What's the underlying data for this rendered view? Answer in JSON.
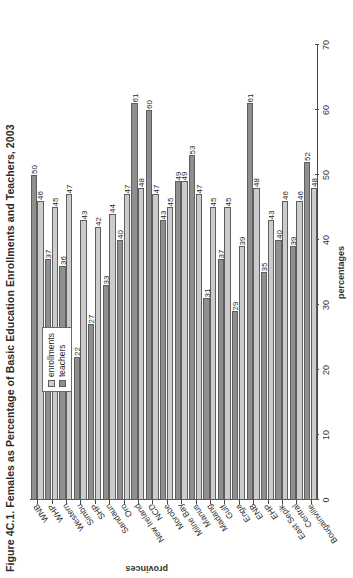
{
  "figure": {
    "title": "Figure 4C.1. Females as Percentage of Basic Education Enrollments and Teachers, 2003"
  },
  "legend": {
    "items": [
      {
        "label": "enrollments",
        "color": "#cccccc",
        "icon": "legend-swatch-icon"
      },
      {
        "label": "teachers",
        "color": "#8f8f8f",
        "icon": "legend-swatch-icon"
      }
    ]
  },
  "chart_data": {
    "type": "bar",
    "title": "Figure 4C.1. Females as Percentage of Basic Education Enrollments and Teachers, 2003",
    "orientation": "horizontal",
    "xlabel": "percentages",
    "ylabel": "provinces",
    "xlim": [
      0,
      70
    ],
    "xticks": [
      0,
      10,
      20,
      30,
      40,
      50,
      60,
      70
    ],
    "grid": false,
    "legend_position": "upper-center",
    "categories": [
      "Bougainville",
      "Central",
      "East Sepik",
      "EHP",
      "ENB",
      "Enga",
      "Gulf",
      "Madang",
      "Manus",
      "Milne Bay",
      "Morobe",
      "NCD",
      "New Ireland",
      "Oro",
      "Sandaun",
      "SHP",
      "Simbu",
      "Western",
      "WHP",
      "WNB"
    ],
    "series": [
      {
        "name": "enrollments",
        "color": "#cccccc",
        "values": [
          48,
          46,
          46,
          43,
          48,
          39,
          45,
          45,
          47,
          49,
          45,
          47,
          48,
          47,
          44,
          42,
          43,
          47,
          45,
          46
        ]
      },
      {
        "name": "teachers",
        "color": "#8f8f8f",
        "values": [
          52,
          39,
          40,
          35,
          61,
          29,
          37,
          31,
          53,
          49,
          43,
          60,
          61,
          40,
          33,
          27,
          22,
          36,
          37,
          50
        ]
      }
    ]
  }
}
